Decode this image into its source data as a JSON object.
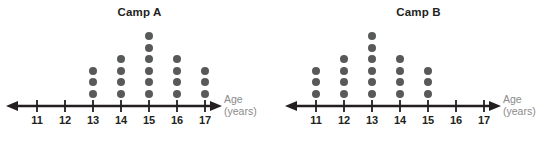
{
  "chart_data": {
    "type": "dot-plot",
    "xlabel": "Age",
    "xlabel_unit": "(years)",
    "categories": [
      11,
      12,
      13,
      14,
      15,
      16,
      17
    ],
    "tick_labels": [
      "11",
      "12",
      "13",
      "14",
      "15",
      "16",
      "17"
    ],
    "grid": false,
    "legend": "none",
    "dot_color": "#58595b",
    "axis_color": "#231f20",
    "label_color": "#8a8a8a",
    "series": [
      {
        "name": "Camp A",
        "values": [
          0,
          0,
          3,
          4,
          6,
          4,
          3
        ]
      },
      {
        "name": "Camp B",
        "values": [
          3,
          4,
          6,
          4,
          3,
          0,
          0
        ]
      }
    ]
  },
  "plots": [
    {
      "id": "camp-a",
      "title": "Camp A",
      "axis_label_line1": "Age",
      "axis_label_line2": "(years)",
      "ticks": [
        {
          "label": "11",
          "count": 0
        },
        {
          "label": "12",
          "count": 0
        },
        {
          "label": "13",
          "count": 3
        },
        {
          "label": "14",
          "count": 4
        },
        {
          "label": "15",
          "count": 6
        },
        {
          "label": "16",
          "count": 4
        },
        {
          "label": "17",
          "count": 3
        }
      ]
    },
    {
      "id": "camp-b",
      "title": "Camp B",
      "axis_label_line1": "Age",
      "axis_label_line2": "(years)",
      "ticks": [
        {
          "label": "11",
          "count": 3
        },
        {
          "label": "12",
          "count": 4
        },
        {
          "label": "13",
          "count": 6
        },
        {
          "label": "14",
          "count": 4
        },
        {
          "label": "15",
          "count": 3
        },
        {
          "label": "16",
          "count": 0
        },
        {
          "label": "17",
          "count": 0
        }
      ]
    }
  ]
}
